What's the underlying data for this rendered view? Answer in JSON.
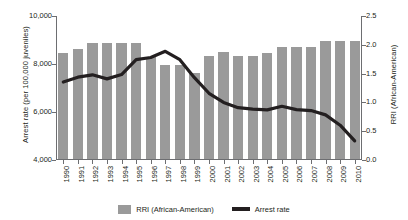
{
  "chart_data": {
    "type": "bar",
    "title": "",
    "xlabel": "",
    "ylabel": "Arrest rate (per 100,000 juveniles)",
    "y2label": "RRI (African-American)",
    "grid": false,
    "legend_position": "bottom",
    "categories": [
      "1990",
      "1991",
      "1992",
      "1993",
      "1994",
      "1995",
      "1996",
      "1997",
      "1998",
      "1999",
      "2000",
      "2001",
      "2002",
      "2003",
      "2004",
      "2005",
      "2006",
      "2007",
      "2008",
      "2009",
      "2010"
    ],
    "ylim": [
      4000,
      10000
    ],
    "yticks": [
      4000,
      6000,
      8000,
      10000
    ],
    "ytick_labels": [
      "4,000",
      "6,000",
      "8,000",
      "10,000"
    ],
    "y2lim": [
      0.0,
      2.5
    ],
    "y2ticks": [
      0.0,
      0.5,
      1.0,
      1.5,
      2.0,
      2.5
    ],
    "y2tick_labels": [
      "0.0",
      "0.5",
      "1.0",
      "1.5",
      "2.0",
      "2.5"
    ],
    "series": [
      {
        "name": "RRI (African-American)",
        "type": "bar",
        "axis": "right",
        "color": "#9a9a9a",
        "values": [
          1.85,
          1.92,
          2.03,
          2.03,
          2.04,
          2.04,
          1.79,
          1.65,
          1.65,
          1.51,
          1.81,
          1.87,
          1.8,
          1.8,
          1.85,
          1.96,
          1.97,
          1.97,
          2.06,
          2.06,
          2.06
        ]
      },
      {
        "name": "Arrest rate",
        "type": "line",
        "axis": "left",
        "color": "#231f20",
        "values": [
          7250,
          7450,
          7550,
          7380,
          7560,
          8180,
          8270,
          8530,
          8180,
          7430,
          6780,
          6400,
          6180,
          6120,
          6090,
          6240,
          6100,
          6060,
          5880,
          5450,
          4800
        ]
      }
    ]
  },
  "legend": {
    "items": [
      {
        "label": "RRI (African-American)",
        "marker": "bar-swatch",
        "color": "#9a9a9a"
      },
      {
        "label": "Arrest rate",
        "marker": "line-swatch",
        "color": "#231f20"
      }
    ]
  }
}
